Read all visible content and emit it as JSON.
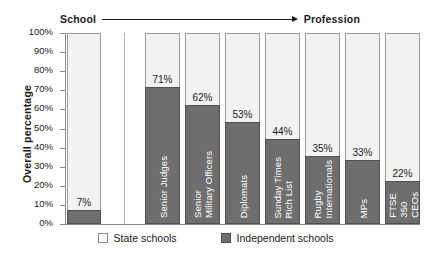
{
  "header": {
    "left_label": "School",
    "right_label": "Profession",
    "arrow_icon": "arrow-right-icon"
  },
  "axis": {
    "y_title": "Overall percentage",
    "y_ticks": [
      "100%",
      "90%",
      "80%",
      "70%",
      "60%",
      "50%",
      "40%",
      "30%",
      "20%",
      "10%",
      "0%"
    ]
  },
  "legend": {
    "items": [
      {
        "label": "State schools",
        "color": "#ffffff",
        "swatch": "state"
      },
      {
        "label": "Independent schools",
        "color": "#6e6e6e",
        "swatch": "independent"
      }
    ]
  },
  "colors": {
    "independent": "#6e6e6e",
    "state": "#f2f2f2",
    "axis": "#8a8a8a",
    "text": "#1a1a1a"
  },
  "chart_data": {
    "type": "bar",
    "title": "",
    "subtitle": "",
    "xlabel": "",
    "ylabel": "Overall percentage",
    "ylim": [
      0,
      100
    ],
    "y_tick_values": [
      0,
      10,
      20,
      30,
      40,
      50,
      60,
      70,
      80,
      90,
      100
    ],
    "grid": false,
    "stacked": true,
    "legend_position": "bottom",
    "annotations": [
      "School",
      "Profession"
    ],
    "categories": [
      "School",
      "Senior Judges",
      "Senior Military Officers",
      "Diplomats",
      "Sunday Times Rich List",
      "Rugby Internationals",
      "MPs",
      "FTSE 350 CEOs"
    ],
    "series": [
      {
        "name": "Independent schools",
        "values": [
          7,
          71,
          62,
          53,
          44,
          35,
          33,
          22
        ]
      },
      {
        "name": "State schools",
        "values": [
          93,
          29,
          38,
          47,
          56,
          65,
          67,
          78
        ]
      }
    ],
    "data_labels": [
      "7%",
      "71%",
      "62%",
      "53%",
      "44%",
      "35%",
      "33%",
      "22%"
    ]
  },
  "bars": [
    {
      "category": "School",
      "value": 7,
      "label": "7%",
      "cat_lines": "",
      "show_cat": false,
      "x": 2,
      "width": 34,
      "group": "school"
    },
    {
      "category": "Senior Judges",
      "value": 71,
      "label": "71%",
      "cat_lines": "Senior Judges",
      "show_cat": true,
      "x": 80,
      "width": 35,
      "group": "profession"
    },
    {
      "category": "Senior Military Officers",
      "value": 62,
      "label": "62%",
      "cat_lines": "Senior\nMilitary Officers",
      "show_cat": true,
      "x": 120,
      "width": 35,
      "group": "profession"
    },
    {
      "category": "Diplomats",
      "value": 53,
      "label": "53%",
      "cat_lines": "Diplomats",
      "show_cat": true,
      "x": 160,
      "width": 35,
      "group": "profession"
    },
    {
      "category": "Sunday Times Rich List",
      "value": 44,
      "label": "44%",
      "cat_lines": "Sunday Times\nRich List",
      "show_cat": true,
      "x": 200,
      "width": 35,
      "group": "profession"
    },
    {
      "category": "Rugby Internationals",
      "value": 35,
      "label": "35%",
      "cat_lines": "Rugby\nInternationals",
      "show_cat": true,
      "x": 240,
      "width": 35,
      "group": "profession"
    },
    {
      "category": "MPs",
      "value": 33,
      "label": "33%",
      "cat_lines": "MPs",
      "show_cat": true,
      "x": 280,
      "width": 35,
      "group": "profession"
    },
    {
      "category": "FTSE 350 CEOs",
      "value": 22,
      "label": "22%",
      "cat_lines": "FTSE\n350\nCEOs",
      "show_cat": true,
      "x": 320,
      "width": 35,
      "group": "profession"
    }
  ],
  "separator": {
    "x": 59
  }
}
